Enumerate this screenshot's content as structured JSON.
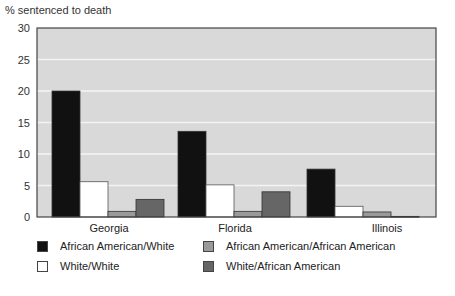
{
  "chart_data": {
    "type": "bar",
    "title": "",
    "ylabel": "% sentenced to death",
    "xlabel": "",
    "ylim": [
      0,
      30
    ],
    "yticks": [
      0,
      5,
      10,
      15,
      20,
      25,
      30
    ],
    "grid": true,
    "legend_position": "bottom",
    "categories": [
      "Georgia",
      "Florida",
      "Illinois"
    ],
    "series": [
      {
        "name": "African American/White",
        "color": "#111111",
        "values": [
          20.0,
          13.6,
          7.6
        ]
      },
      {
        "name": "White/White",
        "color": "#ffffff",
        "values": [
          5.6,
          5.1,
          1.7
        ]
      },
      {
        "name": "African American/African American",
        "color": "#9a9a9a",
        "values": [
          0.9,
          0.9,
          0.8
        ]
      },
      {
        "name": "White/African American",
        "color": "#666666",
        "values": [
          2.8,
          4.0,
          0.1
        ]
      }
    ],
    "plot_background": "#d9d9d9"
  }
}
